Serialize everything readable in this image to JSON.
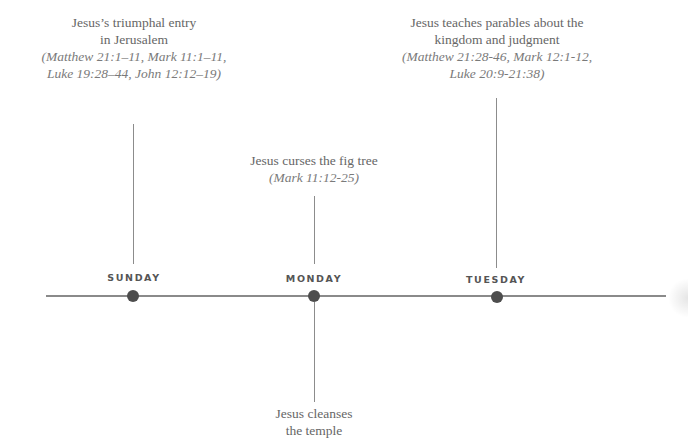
{
  "timeline": {
    "line_color": "#8a8a8a",
    "dot_color": "#4d4d4d",
    "days": [
      {
        "label": "SUNDAY"
      },
      {
        "label": "MONDAY"
      },
      {
        "label": "TUESDAY"
      }
    ]
  },
  "events": {
    "sunday_top": {
      "title_line1": "Jesus’s triumphal entry",
      "title_line2": "in Jerusalem",
      "ref_line1": "(Matthew 21:1–11, Mark 11:1–11,",
      "ref_line2": "Luke 19:28–44, John 12:12–19)"
    },
    "monday_top": {
      "title_line1": "Jesus curses the fig tree",
      "ref_line1": "(Mark 11:12-25)"
    },
    "monday_bottom": {
      "title_line1": "Jesus cleanses",
      "title_line2": "the temple"
    },
    "tuesday_top": {
      "title_line1": "Jesus teaches parables about the",
      "title_line2": "kingdom and judgment",
      "ref_line1": "(Matthew 21:28-46, Mark 12:1-12,",
      "ref_line2": "Luke 20:9-21:38)"
    }
  }
}
